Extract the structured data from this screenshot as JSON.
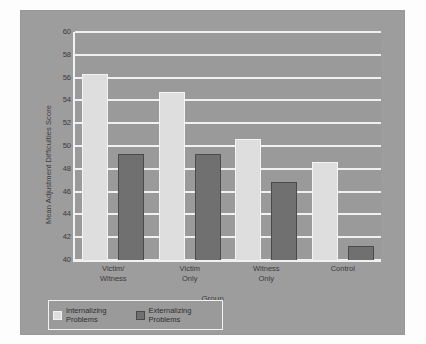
{
  "chart_data": {
    "type": "bar",
    "title": "",
    "xlabel": "Group",
    "ylabel": "Mean Adjustment Difficulties Score",
    "categories": [
      "Victim/ Witness",
      "Victim Only",
      "Witness Only",
      "Control"
    ],
    "category_lines": [
      [
        "Victim/",
        "Witness"
      ],
      [
        "Victim",
        "Only"
      ],
      [
        "Witness",
        "Only"
      ],
      [
        "Control",
        ""
      ]
    ],
    "series": [
      {
        "name": "Internalizing Problems",
        "color": "#dedede",
        "values": [
          56.3,
          54.7,
          50.6,
          48.6
        ]
      },
      {
        "name": "Externalizing Problems",
        "color": "#707070",
        "values": [
          49.3,
          49.3,
          46.8,
          41.2
        ]
      }
    ],
    "ylim": [
      40,
      60
    ],
    "ytick_step": 2,
    "ytick_labels": [
      "40",
      "42",
      "44",
      "46",
      "48",
      "50",
      "52",
      "54",
      "56",
      "58",
      "60"
    ],
    "grid": true,
    "grid_axis": "y",
    "legend_position": "bottom-left",
    "background_color": "#9a9a9a",
    "gridline_color": "#f0f0f0",
    "axis_color": "#f2f2f2",
    "text_color": "#3b3b3b"
  },
  "legend": {
    "entries": [
      {
        "label_line1": "Internalizing",
        "label_line2": "Problems",
        "swatch": "internal"
      },
      {
        "label_line1": "Externalizing",
        "label_line2": "Problems",
        "swatch": "external"
      }
    ]
  }
}
